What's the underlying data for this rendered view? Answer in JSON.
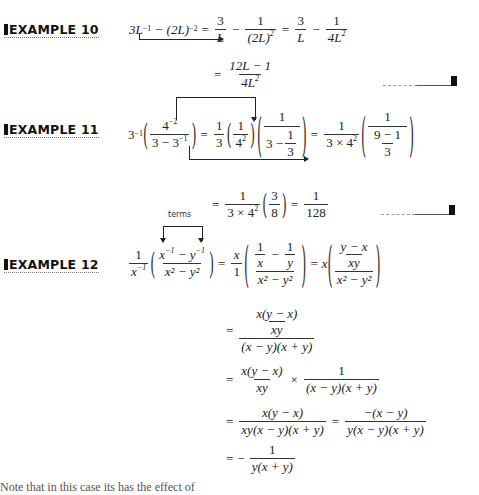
{
  "examples": [
    {
      "label": "EXAMPLE 10",
      "lines": [
        "3L^-1 - (2L)^-2 = 3/L - 1/(2L)^2 = 3/L - 1/(4L^2)",
        "= (12L - 1)/(4L^2)"
      ],
      "parts": {
        "lhs_a": "3L",
        "lhs_a_exp": "−1",
        "minus": "−",
        "lhs_b": "(2L)",
        "lhs_b_exp": "−2",
        "eq": "=",
        "f1_num": "3",
        "f1_den": "L",
        "f2_num": "1",
        "f2_den": "(2L)",
        "f2_den_exp": "2",
        "f3_num": "3",
        "f3_den": "L",
        "f4_num": "1",
        "f4_den": "4L",
        "f4_den_exp": "2",
        "r_num": "12L − 1",
        "r_den": "4L",
        "r_den_exp": "2"
      }
    },
    {
      "label": "EXAMPLE 11",
      "lines": [
        "3^-1 (4^-2 / (3 - 3^-1)) = 1/3 (1/4^2) (1/(3 - 1/3)) = 1/(3 × 4^2) (1/((9 - 1)/3))",
        "= 1/(3 × 4^2) (3/8) = 1/128"
      ],
      "parts": {
        "base": "3",
        "base_exp": "−1",
        "n_num": "4",
        "n_num_exp": "−2",
        "n_den": "3 − 3",
        "n_den_exp": "−1",
        "a_num": "1",
        "a_den": "3",
        "b_num": "1",
        "b_den": "4",
        "b_den_exp": "2",
        "c_num": "1",
        "c_den_a": "3 −",
        "c_den_fnum": "1",
        "c_den_fden": "3",
        "d_num": "1",
        "d_den": "3 × 4",
        "d_den_exp": "2",
        "e_num": "1",
        "e_den_num": "9 − 1",
        "e_den_den": "3",
        "g_num": "3",
        "g_den": "8",
        "h_num": "1",
        "h_den": "128"
      }
    },
    {
      "label": "EXAMPLE 12",
      "annotation": "terms",
      "lines": [
        "1/x^-1 ((x^-1 - y^-1)/(x^2 - y^2)) = x/1 ((1/x - 1/y)/(x^2 - y^2)) = x (((y - x)/xy)/(x^2 - y^2))",
        "= (x(y - x)/xy) / ((x - y)(x + y))",
        "= x(y - x)/xy × 1/((x - y)(x + y))",
        "= x(y - x)/(xy(x - y)(x + y)) = -(x - y)/(y(x - y)(x + y))",
        "= - 1/(y(x + y))"
      ],
      "parts": {
        "p_num": "1",
        "p_den": "x",
        "p_den_exp": "−1",
        "q_num_a": "x",
        "q_num_a_exp": "−1",
        "q_num_m": "−",
        "q_num_b": "y",
        "q_num_b_exp": "−1",
        "q_den": "x² − y²",
        "s_num": "x",
        "s_den": "1",
        "t_1": "1",
        "t_x": "x",
        "t_y": "y",
        "t_den": "x² − y²",
        "u_x": "x",
        "u_num": "y − x",
        "u_den": "xy",
        "u_dden": "x² − y²",
        "l2_nn": "x(y − x)",
        "l2_nd": "xy",
        "l2_d": "(x − y)(x + y)",
        "l3_num": "x(y − x)",
        "l3_den": "xy",
        "l3_times": "×",
        "l3_num2": "1",
        "l3_den2": "(x − y)(x + y)",
        "l4_num": "x(y − x)",
        "l4_den": "xy(x − y)(x + y)",
        "l4_num2": "−(x − y)",
        "l4_den2": "y(x − y)(x + y)",
        "l5_minus": "−",
        "l5_num": "1",
        "l5_den": "y(x + y)"
      }
    }
  ],
  "bottom_text": "Note that in this case its has the effect of"
}
